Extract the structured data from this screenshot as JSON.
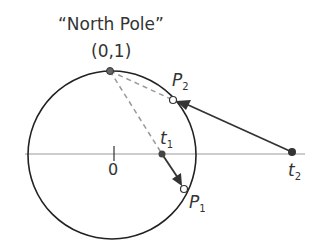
{
  "title": "“North Pole”",
  "north_pole_coord": "(0,1)",
  "origin_label": "0",
  "points": {
    "P1": {
      "letter": "P",
      "sub": "1"
    },
    "P2": {
      "letter": "P",
      "sub": "2"
    },
    "t1": {
      "letter": "t",
      "sub": "1"
    },
    "t2": {
      "letter": "t",
      "sub": "2"
    }
  },
  "colors": {
    "line": "#222222",
    "axis": "#888888",
    "dashed": "#999999",
    "point": "#444444"
  }
}
